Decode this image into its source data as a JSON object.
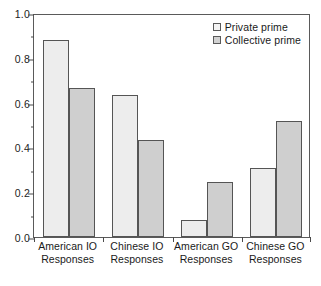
{
  "chart_data": {
    "type": "bar",
    "title": "",
    "xlabel": "",
    "ylabel": "",
    "ylim": [
      0.0,
      1.0
    ],
    "grid": false,
    "legend_position": "top-right",
    "categories": [
      "American IO Responses",
      "Chinese IO Responses",
      "American GO Responses",
      "Chinese GO Responses"
    ],
    "category_lines": [
      [
        "American IO",
        "Responses"
      ],
      [
        "Chinese IO",
        "Responses"
      ],
      [
        "American GO",
        "Responses"
      ],
      [
        "Chinese GO",
        "Responses"
      ]
    ],
    "series": [
      {
        "name": "Private prime",
        "color": "#ededed",
        "values": [
          0.88,
          0.635,
          0.075,
          0.31
        ]
      },
      {
        "name": "Collective prime",
        "color": "#cfcfcf",
        "values": [
          0.665,
          0.435,
          0.245,
          0.52
        ]
      }
    ],
    "y_ticks_major": [
      0.0,
      0.2,
      0.4,
      0.6,
      0.8,
      1.0
    ],
    "y_tick_labels": [
      "0.0",
      "0.2",
      "0.4",
      "0.6",
      "0.8",
      "1.0"
    ],
    "y_ticks_minor": [
      0.1,
      0.3,
      0.5,
      0.7,
      0.9
    ]
  },
  "axes": {
    "y_tick_labels": [
      "1.0",
      "0.8",
      "0.6",
      "0.4",
      "0.2",
      "0.0"
    ]
  },
  "legend": {
    "items": [
      {
        "label": "Private prime"
      },
      {
        "label": "Collective prime"
      }
    ]
  }
}
